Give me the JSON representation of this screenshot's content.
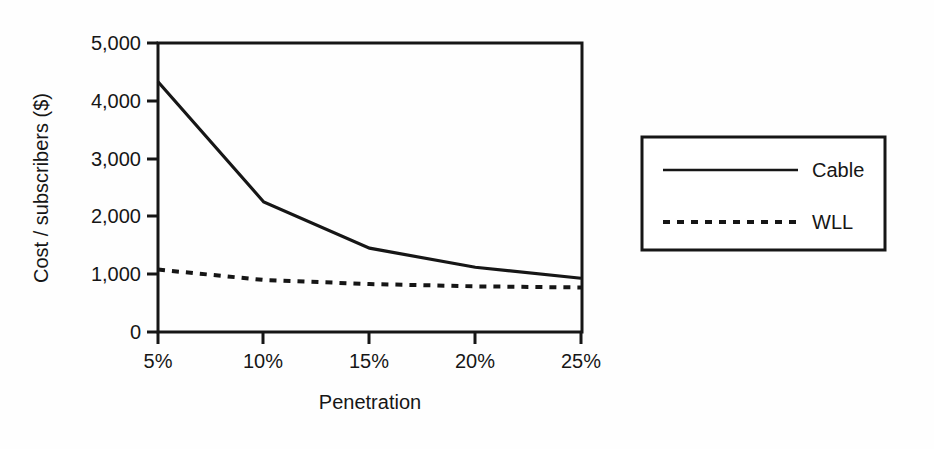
{
  "chart_data": {
    "type": "line",
    "title": "",
    "xlabel": "Penetration",
    "ylabel": "Cost / subscribers ($)",
    "x": [
      "5%",
      "10%",
      "15%",
      "20%",
      "25%"
    ],
    "xtick_labels": [
      "5%",
      "10%",
      "15%",
      "20%",
      "25%"
    ],
    "ytick_labels": [
      "0",
      "1,000",
      "2,000",
      "3,000",
      "4,000",
      "5,000"
    ],
    "ytick_values": [
      0,
      1000,
      2000,
      3000,
      4000,
      5000
    ],
    "ylim": [
      0,
      5000
    ],
    "grid": false,
    "legend_position": "right-outside",
    "series": [
      {
        "name": "Cable",
        "style": "solid",
        "color": "#161616",
        "values": [
          4330,
          2250,
          1450,
          1120,
          930
        ]
      },
      {
        "name": "WLL",
        "style": "dashed",
        "color": "#161616",
        "values": [
          1080,
          900,
          830,
          790,
          770
        ]
      }
    ]
  },
  "legend": {
    "items": [
      {
        "label": "Cable",
        "style": "solid"
      },
      {
        "label": "WLL",
        "style": "dashed"
      }
    ]
  },
  "axes": {
    "y_title": "Cost / subscribers ($)",
    "x_title": "Penetration",
    "y_ticks": [
      {
        "label": "5,000"
      },
      {
        "label": "4,000"
      },
      {
        "label": "3,000"
      },
      {
        "label": "2,000"
      },
      {
        "label": "1,000"
      },
      {
        "label": "0"
      }
    ],
    "x_ticks": [
      {
        "label": "5%"
      },
      {
        "label": "10%"
      },
      {
        "label": "15%"
      },
      {
        "label": "20%"
      },
      {
        "label": "25%"
      }
    ]
  }
}
